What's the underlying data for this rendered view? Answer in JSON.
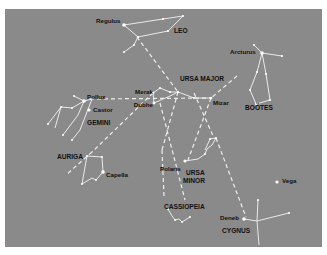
{
  "figure": {
    "background_color": "#8a8a8a",
    "frame_color": "#ffffff",
    "line_color": "#f2f2f2",
    "star_color": "#ffffff",
    "text_color": "#111111"
  },
  "star_labels": {
    "regulus": "Regulus",
    "arcturus": "Arcturus",
    "pollux": "Pollux",
    "castor": "Castor",
    "merak": "Merak",
    "dubhe": "Dubhe",
    "mizar": "Mizar",
    "capella": "Capella",
    "polaris": "Polaris",
    "vega": "Vega",
    "deneb": "Deneb"
  },
  "constellation_labels": {
    "leo": "LEO",
    "ursa_major": "URSA MAJOR",
    "bootes": "BOÖTES",
    "gemini": "GEMINI",
    "auriga": "AURIGA",
    "ursa_minor_1": "URSA",
    "ursa_minor_2": "MINOR",
    "cassiopeia": "CASSIOPEIA",
    "cygnus": "CYGNUS"
  }
}
